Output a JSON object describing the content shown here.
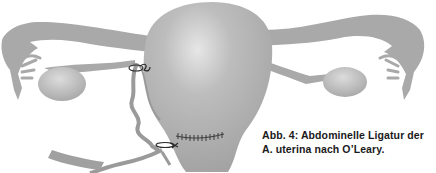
{
  "figure": {
    "caption_line1": "Abb. 4:  Abdominelle Ligatur der",
    "caption_line2": "A. uterina nach O’Leary.",
    "colors": {
      "tissue": "#a9a9a9",
      "tissue_dark": "#8f8f8f",
      "highlight": "#d8d8d8",
      "suture": "#2a2a2a",
      "background": "#ffffff"
    }
  }
}
